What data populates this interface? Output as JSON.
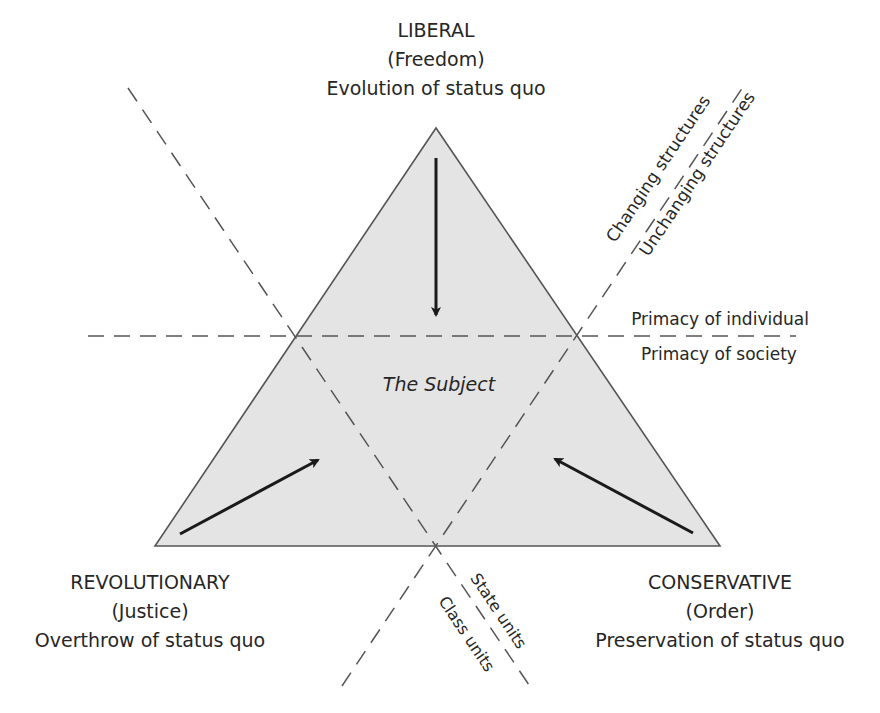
{
  "diagram": {
    "type": "triangle-ideology-diagram",
    "center_label": "The Subject",
    "vertices": {
      "top": {
        "title": "LIBERAL",
        "value": "(Freedom)",
        "description": "Evolution of status quo"
      },
      "bottom_left": {
        "title": "REVOLUTIONARY",
        "value": "(Justice)",
        "description": "Overthrow of status quo"
      },
      "bottom_right": {
        "title": "CONSERVATIVE",
        "value": "(Order)",
        "description": "Preservation of status quo"
      }
    },
    "axes": {
      "horizontal": {
        "above": "Primacy of individual",
        "below": "Primacy of society"
      },
      "diagonal_right": {
        "upper": "Changing structures",
        "lower": "Unchanging structures"
      },
      "diagonal_bottom": {
        "upper": "State units",
        "lower": "Class units"
      }
    },
    "arrows": [
      {
        "from": "top",
        "to": "center"
      },
      {
        "from": "bottom_left",
        "to": "center"
      },
      {
        "from": "bottom_right",
        "to": "center"
      }
    ],
    "colors": {
      "triangle_fill": "#e4e4e4",
      "triangle_stroke": "#555555",
      "dashed_line": "#555555",
      "arrow": "#1a1a1a",
      "text": "#262626"
    }
  }
}
